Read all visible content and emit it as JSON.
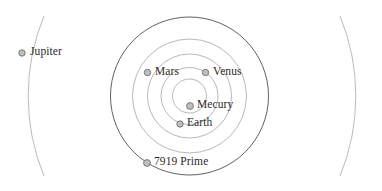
{
  "figure": {
    "type": "orbital-diagram",
    "background_color": "#ffffff",
    "width": 382,
    "height": 191,
    "center": {
      "x": 189.5,
      "y": 96
    },
    "orbit_color": "#8c8c8c",
    "outer_orbit_color": "#5a5a5a",
    "marker_fill": "#bfbfbf",
    "marker_stroke": "#6e6e6e",
    "label_color": "#2b2b2b"
  },
  "orbits": [
    {
      "name": "mercury-orbit",
      "radius": 17,
      "stroke": "#9a9a9a",
      "width": 0.7
    },
    {
      "name": "earth-orbit",
      "radius": 28.5,
      "stroke": "#9a9a9a",
      "width": 0.7
    },
    {
      "name": "venus-orbit",
      "radius": 42,
      "stroke": "#9a9a9a",
      "width": 0.7
    },
    {
      "name": "mars-orbit",
      "radius": 57,
      "stroke": "#9a9a9a",
      "width": 0.7
    },
    {
      "name": "prime-orbit",
      "radius": 79,
      "stroke": "#4f4f4f",
      "width": 0.9
    }
  ],
  "jupiter_orbit": {
    "name": "jupiter-orbit",
    "radius": 210,
    "stroke": "#a8a8a8",
    "width": 0.8
  },
  "bodies": [
    {
      "id": "jupiter",
      "label": "Jupiter",
      "marker": {
        "cx": 22,
        "cy": 53,
        "r": 3.2
      },
      "label_pos": {
        "x": 30,
        "y": 47
      }
    },
    {
      "id": "mars",
      "label": "Mars",
      "marker": {
        "cx": 147.5,
        "cy": 72.5,
        "r": 3.2
      },
      "label_pos": {
        "x": 155,
        "y": 66
      }
    },
    {
      "id": "venus",
      "label": "Venus",
      "marker": {
        "cx": 205.5,
        "cy": 72.5,
        "r": 3.2
      },
      "label_pos": {
        "x": 213,
        "y": 66
      }
    },
    {
      "id": "mecury",
      "label": "Mecury",
      "marker": {
        "cx": 190,
        "cy": 106,
        "r": 3.4
      },
      "label_pos": {
        "x": 197,
        "y": 99.5
      }
    },
    {
      "id": "earth",
      "label": "Earth",
      "marker": {
        "cx": 180,
        "cy": 124,
        "r": 3.2
      },
      "label_pos": {
        "x": 187,
        "y": 117.5
      }
    },
    {
      "id": "prime-7919",
      "label": "7919 Prime",
      "marker": {
        "cx": 147,
        "cy": 163,
        "r": 3.4
      },
      "label_pos": {
        "x": 154,
        "y": 156.5
      }
    }
  ]
}
